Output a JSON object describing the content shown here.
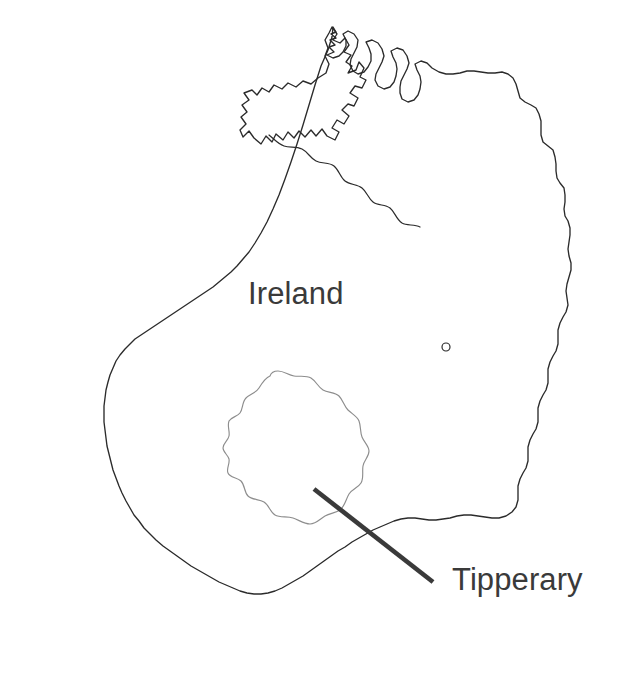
{
  "figure": {
    "kind": "outline-map",
    "region": "island-of-ireland",
    "background_color": "#ffffff",
    "width": 625,
    "height": 693
  },
  "labels": {
    "country": "Ireland",
    "county": "Tipperary"
  },
  "colors": {
    "coastline_stroke": "#2b2b2b",
    "internal_border_stroke": "#2b2b2b",
    "county_outline_stroke": "#8d8d8d",
    "leader_line_stroke": "#3a3a3a",
    "text_fill": "#3a3a3a",
    "background": "#ffffff"
  },
  "annotations": {
    "leader_line": {
      "name": "tipperary-leader-line",
      "from_x": 314,
      "from_y": 489,
      "to_x": 433,
      "to_y": 582
    },
    "country_label_position": {
      "x": 248,
      "y": 304
    },
    "county_label_position": {
      "x": 452,
      "y": 590
    }
  },
  "features": {
    "coastline_name": "ireland-coastline",
    "border_name": "northern-ireland-border",
    "county_name": "county-tipperary-outline",
    "bay_marker_name": "dublin-bay-marker"
  }
}
